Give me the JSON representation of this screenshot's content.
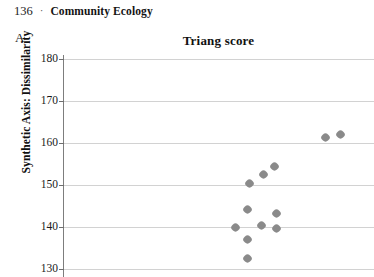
{
  "running_head": {
    "folio": "136",
    "separator": "·",
    "title": "Community Ecology"
  },
  "panel": {
    "letter": "A"
  },
  "chart_data": {
    "type": "scatter",
    "title": "Triang score",
    "xlabel": "",
    "ylabel": "Synthetic Axis: Dissimilarity",
    "ylim": [
      128,
      181
    ],
    "yticks": [
      180,
      170,
      160,
      150,
      140,
      130
    ],
    "ytick_labels": [
      "180",
      "170",
      "160",
      "150",
      "140",
      "130"
    ],
    "grid": "horizontal",
    "legend": "none",
    "marker": "diamond",
    "marker_color": "#8a8a8a",
    "points": [
      {
        "x": 14.3,
        "y": 162.0
      },
      {
        "x": 13.5,
        "y": 161.4
      },
      {
        "x": 10.9,
        "y": 154.5
      },
      {
        "x": 10.3,
        "y": 152.4
      },
      {
        "x": 9.6,
        "y": 150.3
      },
      {
        "x": 9.5,
        "y": 144.0
      },
      {
        "x": 11.0,
        "y": 143.1
      },
      {
        "x": 10.2,
        "y": 140.2
      },
      {
        "x": 11.0,
        "y": 139.5
      },
      {
        "x": 8.9,
        "y": 139.8
      },
      {
        "x": 9.5,
        "y": 137.0
      },
      {
        "x": 9.5,
        "y": 132.5
      }
    ],
    "xlim": [
      0,
      16
    ]
  }
}
